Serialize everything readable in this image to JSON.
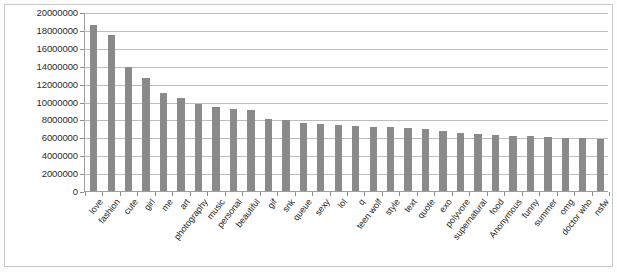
{
  "chart_data": {
    "type": "bar",
    "title": "",
    "subtitle": "",
    "xlabel": "",
    "ylabel": "",
    "ylim": [
      0,
      20000000
    ],
    "ytick_step": 2000000,
    "grid": true,
    "legend": false,
    "bar_color": "#8a8a8a",
    "categories": [
      "love",
      "fashion",
      "cute",
      "girl",
      "me",
      "art",
      "photography",
      "music",
      "personal",
      "beautiful",
      "gif",
      "snk",
      "queue",
      "sexy",
      "lol",
      "q",
      "teen wolf",
      "style",
      "text",
      "quote",
      "exo",
      "polyvore",
      "supernatural",
      "food",
      "Anonymous",
      "funny",
      "summer",
      "omg",
      "doctor who",
      "nsfw"
    ],
    "values": [
      18600000,
      17400000,
      13900000,
      12600000,
      11000000,
      10400000,
      9700000,
      9400000,
      9200000,
      9000000,
      8100000,
      7900000,
      7600000,
      7500000,
      7400000,
      7300000,
      7200000,
      7100000,
      7000000,
      6900000,
      6700000,
      6500000,
      6400000,
      6300000,
      6200000,
      6100000,
      6000000,
      5950000,
      5900000,
      5800000
    ],
    "ytick_labels": [
      "0",
      "2000000",
      "4000000",
      "6000000",
      "8000000",
      "10000000",
      "12000000",
      "14000000",
      "16000000",
      "18000000",
      "20000000"
    ]
  }
}
